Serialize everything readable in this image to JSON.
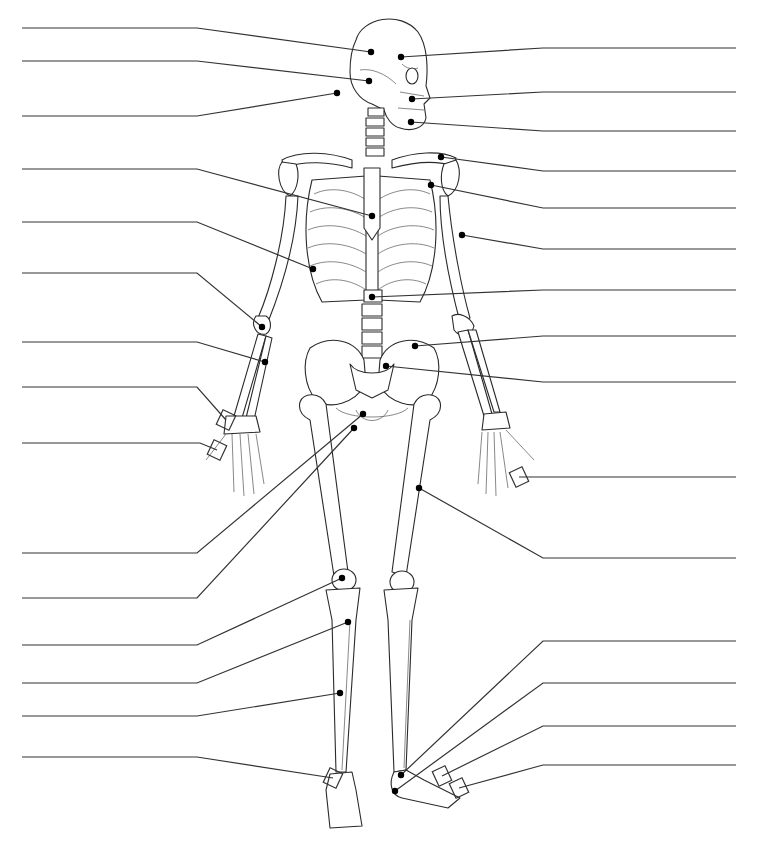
{
  "diagram": {
    "title": "",
    "line_color": "#333333",
    "dot_color": "#000000",
    "background": "#ffffff"
  },
  "left_labels": [
    {
      "id": "L1",
      "text": "",
      "line_y": 28,
      "target": [
        371,
        52
      ],
      "bend_x": 197
    },
    {
      "id": "L2",
      "text": "",
      "line_y": 61,
      "target": [
        369,
        81
      ],
      "bend_x": 197
    },
    {
      "id": "L3",
      "text": "",
      "line_y": 116,
      "target": [
        337,
        93
      ],
      "bend_x": 197
    },
    {
      "id": "L4",
      "text": "",
      "line_y": 169,
      "target": [
        372,
        216
      ],
      "bend_x": 197
    },
    {
      "id": "L5",
      "text": "",
      "line_y": 222,
      "target": [
        313,
        269
      ],
      "bend_x": 197
    },
    {
      "id": "L6",
      "text": "",
      "line_y": 273,
      "target": [
        262,
        327
      ],
      "bend_x": 197
    },
    {
      "id": "L7",
      "text": "",
      "line_y": 342,
      "target": [
        265,
        362
      ],
      "bend_x": 197
    },
    {
      "id": "L8",
      "text": "",
      "line_y": 387,
      "target": [
        226,
        420
      ],
      "bend_x": 197,
      "bracket": true
    },
    {
      "id": "L9",
      "text": "",
      "line_y": 443,
      "target": [
        217,
        450
      ],
      "bend_x": 200,
      "bracket": true
    },
    {
      "id": "L10",
      "text": "",
      "line_y": 553,
      "target": [
        363,
        414
      ],
      "bend_x": 197
    },
    {
      "id": "L11",
      "text": "",
      "line_y": 598,
      "target": [
        354,
        428
      ],
      "bend_x": 197
    },
    {
      "id": "L12",
      "text": "",
      "line_y": 645,
      "target": [
        342,
        578
      ],
      "bend_x": 197
    },
    {
      "id": "L13",
      "text": "",
      "line_y": 683,
      "target": [
        348,
        622
      ],
      "bend_x": 197
    },
    {
      "id": "L14",
      "text": "",
      "line_y": 716,
      "target": [
        340,
        693
      ],
      "bend_x": 197
    },
    {
      "id": "L15",
      "text": "",
      "line_y": 757,
      "target": [
        333,
        778
      ],
      "bend_x": 197,
      "bracket": true
    }
  ],
  "right_labels": [
    {
      "id": "R1",
      "text": "",
      "line_y": 48,
      "target": [
        401,
        57
      ],
      "bend_x": 543
    },
    {
      "id": "R2",
      "text": "",
      "line_y": 92,
      "target": [
        412,
        99
      ],
      "bend_x": 543
    },
    {
      "id": "R3",
      "text": "",
      "line_y": 131,
      "target": [
        411,
        122
      ],
      "bend_x": 543
    },
    {
      "id": "R4",
      "text": "",
      "line_y": 171,
      "target": [
        441,
        157
      ],
      "bend_x": 543
    },
    {
      "id": "R5",
      "text": "",
      "line_y": 208,
      "target": [
        431,
        185
      ],
      "bend_x": 543
    },
    {
      "id": "R6",
      "text": "",
      "line_y": 249,
      "target": [
        462,
        235
      ],
      "bend_x": 543
    },
    {
      "id": "R7",
      "text": "",
      "line_y": 290,
      "target": [
        372,
        297
      ],
      "bend_x": 543
    },
    {
      "id": "R8",
      "text": "",
      "line_y": 336,
      "target": [
        415,
        346
      ],
      "bend_x": 543
    },
    {
      "id": "R9",
      "text": "",
      "line_y": 382,
      "target": [
        386,
        366
      ],
      "bend_x": 543
    },
    {
      "id": "R10",
      "text": "",
      "line_y": 477,
      "target": [
        519,
        477
      ],
      "bend_x": 543,
      "bracket": true
    },
    {
      "id": "R11",
      "text": "",
      "line_y": 558,
      "target": [
        419,
        488
      ],
      "bend_x": 543
    },
    {
      "id": "R12",
      "text": "",
      "line_y": 641,
      "target": [
        401,
        775
      ],
      "bend_x": 543
    },
    {
      "id": "R13",
      "text": "",
      "line_y": 683,
      "target": [
        395,
        791
      ],
      "bend_x": 543
    },
    {
      "id": "R14",
      "text": "",
      "line_y": 726,
      "target": [
        442,
        776
      ],
      "bend_x": 543,
      "bracket": true
    },
    {
      "id": "R15",
      "text": "",
      "line_y": 765,
      "target": [
        459,
        788
      ],
      "bend_x": 543,
      "bracket": true
    }
  ],
  "line_extents": {
    "left_start_x": 22,
    "right_end_x": 736
  }
}
